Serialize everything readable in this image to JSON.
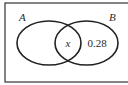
{
  "diagram": {
    "type": "venn",
    "sets": [
      {
        "name": "A",
        "label": "A"
      },
      {
        "name": "B",
        "label": "B"
      }
    ],
    "regions": {
      "intersection": "x",
      "b_only": "0.28",
      "a_only": ""
    },
    "colors": {
      "stroke": "#222222",
      "frame": "#333333",
      "background": "#ffffff"
    }
  }
}
